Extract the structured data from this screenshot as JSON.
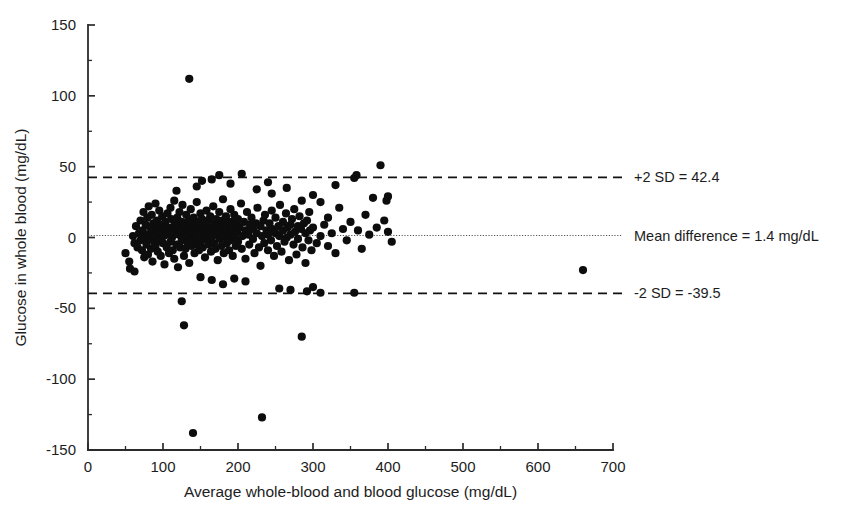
{
  "chart_data": {
    "type": "scatter",
    "title": "",
    "xlabel": "Average whole-blood and blood glucose (mg/dL)",
    "ylabel": "Glucose in whole blood (mg/dL)",
    "xlim": [
      0,
      700
    ],
    "ylim": [
      -150,
      150
    ],
    "xticks": [
      0,
      100,
      200,
      300,
      400,
      500,
      600,
      700
    ],
    "xtick_labels": [
      "0",
      "100",
      "200",
      "300",
      "400",
      "500",
      "600",
      "700"
    ],
    "x_minor_step": 50,
    "yticks": [
      -150,
      -100,
      -50,
      0,
      50,
      100,
      150
    ],
    "ytick_labels": [
      "-150",
      "-100",
      "-50",
      "0",
      "50",
      "100",
      "150"
    ],
    "y_minor_step": 25,
    "grid": false,
    "legend_position": "right-inline",
    "reference_lines": [
      {
        "name": "upper-limit-of-agreement",
        "label": "+2 SD = 42.4",
        "value": 42.4,
        "style": "dashed",
        "color": "#111111"
      },
      {
        "name": "mean-difference",
        "label": "Mean difference = 1.4 mg/dL",
        "value": 1.4,
        "style": "dotted",
        "color": "#555555"
      },
      {
        "name": "lower-limit-of-agreement",
        "label": "-2 SD = -39.5",
        "value": -39.5,
        "style": "dashed",
        "color": "#111111"
      }
    ],
    "marker": {
      "shape": "circle",
      "size": 4.1,
      "color": "#0d0d0d"
    },
    "points": [
      [
        50,
        -11
      ],
      [
        56,
        -22
      ],
      [
        60,
        1
      ],
      [
        62,
        -4
      ],
      [
        64,
        8
      ],
      [
        66,
        -7
      ],
      [
        68,
        3
      ],
      [
        70,
        12
      ],
      [
        70,
        -2
      ],
      [
        72,
        -9
      ],
      [
        73,
        5
      ],
      [
        74,
        18
      ],
      [
        75,
        -14
      ],
      [
        76,
        0
      ],
      [
        77,
        9
      ],
      [
        78,
        -5
      ],
      [
        79,
        14
      ],
      [
        80,
        2
      ],
      [
        80,
        -12
      ],
      [
        81,
        22
      ],
      [
        82,
        -1
      ],
      [
        83,
        7
      ],
      [
        84,
        -8
      ],
      [
        85,
        16
      ],
      [
        86,
        3
      ],
      [
        86,
        -17
      ],
      [
        87,
        10
      ],
      [
        88,
        -3
      ],
      [
        89,
        5
      ],
      [
        90,
        24
      ],
      [
        90,
        -6
      ],
      [
        91,
        1
      ],
      [
        92,
        12
      ],
      [
        93,
        -10
      ],
      [
        94,
        6
      ],
      [
        95,
        19
      ],
      [
        95,
        -2
      ],
      [
        96,
        8
      ],
      [
        97,
        -13
      ],
      [
        98,
        3
      ],
      [
        99,
        15
      ],
      [
        100,
        -4
      ],
      [
        100,
        9
      ],
      [
        101,
        1
      ],
      [
        102,
        -19
      ],
      [
        103,
        11
      ],
      [
        104,
        5
      ],
      [
        105,
        -7
      ],
      [
        106,
        17
      ],
      [
        107,
        2
      ],
      [
        108,
        -11
      ],
      [
        109,
        7
      ],
      [
        110,
        21
      ],
      [
        110,
        -3
      ],
      [
        111,
        13
      ],
      [
        112,
        0
      ],
      [
        113,
        -9
      ],
      [
        114,
        6
      ],
      [
        115,
        26
      ],
      [
        115,
        -15
      ],
      [
        116,
        10
      ],
      [
        117,
        3
      ],
      [
        118,
        -5
      ],
      [
        119,
        14
      ],
      [
        120,
        8
      ],
      [
        120,
        -21
      ],
      [
        121,
        2
      ],
      [
        122,
        18
      ],
      [
        123,
        -7
      ],
      [
        124,
        5
      ],
      [
        125,
        11
      ],
      [
        125,
        -2
      ],
      [
        126,
        23
      ],
      [
        127,
        0
      ],
      [
        128,
        -13
      ],
      [
        129,
        9
      ],
      [
        130,
        4
      ],
      [
        130,
        -8
      ],
      [
        131,
        16
      ],
      [
        132,
        1
      ],
      [
        133,
        -4
      ],
      [
        134,
        12
      ],
      [
        135,
        7
      ],
      [
        135,
        -18
      ],
      [
        136,
        3
      ],
      [
        137,
        20
      ],
      [
        138,
        -6
      ],
      [
        139,
        10
      ],
      [
        140,
        5
      ],
      [
        140,
        -1
      ],
      [
        141,
        14
      ],
      [
        142,
        -11
      ],
      [
        143,
        8
      ],
      [
        144,
        2
      ],
      [
        145,
        25
      ],
      [
        145,
        -5
      ],
      [
        146,
        11
      ],
      [
        147,
        0
      ],
      [
        148,
        -9
      ],
      [
        149,
        6
      ],
      [
        150,
        17
      ],
      [
        150,
        -3
      ],
      [
        151,
        9
      ],
      [
        152,
        13
      ],
      [
        153,
        -7
      ],
      [
        154,
        4
      ],
      [
        155,
        1
      ],
      [
        156,
        -14
      ],
      [
        157,
        8
      ],
      [
        158,
        19
      ],
      [
        159,
        -2
      ],
      [
        160,
        6
      ],
      [
        160,
        12
      ],
      [
        161,
        -5
      ],
      [
        162,
        3
      ],
      [
        163,
        15
      ],
      [
        164,
        -10
      ],
      [
        165,
        7
      ],
      [
        166,
        1
      ],
      [
        167,
        22
      ],
      [
        168,
        -4
      ],
      [
        169,
        10
      ],
      [
        170,
        5
      ],
      [
        170,
        -8
      ],
      [
        171,
        13
      ],
      [
        172,
        2
      ],
      [
        173,
        -16
      ],
      [
        174,
        9
      ],
      [
        175,
        4
      ],
      [
        175,
        18
      ],
      [
        176,
        -1
      ],
      [
        177,
        7
      ],
      [
        178,
        -6
      ],
      [
        179,
        12
      ],
      [
        180,
        3
      ],
      [
        180,
        27
      ],
      [
        181,
        -11
      ],
      [
        182,
        8
      ],
      [
        183,
        1
      ],
      [
        184,
        15
      ],
      [
        185,
        -4
      ],
      [
        186,
        6
      ],
      [
        187,
        10
      ],
      [
        188,
        -9
      ],
      [
        189,
        2
      ],
      [
        190,
        20
      ],
      [
        190,
        -2
      ],
      [
        191,
        11
      ],
      [
        192,
        5
      ],
      [
        193,
        -13
      ],
      [
        194,
        8
      ],
      [
        195,
        16
      ],
      [
        196,
        0
      ],
      [
        197,
        -6
      ],
      [
        198,
        9
      ],
      [
        199,
        4
      ],
      [
        200,
        13
      ],
      [
        200,
        -3
      ],
      [
        202,
        7
      ],
      [
        204,
        24
      ],
      [
        205,
        -8
      ],
      [
        206,
        1
      ],
      [
        208,
        11
      ],
      [
        210,
        5
      ],
      [
        210,
        -15
      ],
      [
        212,
        18
      ],
      [
        214,
        2
      ],
      [
        215,
        -5
      ],
      [
        216,
        9
      ],
      [
        218,
        14
      ],
      [
        220,
        -1
      ],
      [
        220,
        6
      ],
      [
        222,
        -11
      ],
      [
        224,
        10
      ],
      [
        225,
        3
      ],
      [
        226,
        21
      ],
      [
        228,
        -7
      ],
      [
        230,
        8
      ],
      [
        230,
        -20
      ],
      [
        232,
        1
      ],
      [
        234,
        12
      ],
      [
        235,
        -4
      ],
      [
        236,
        16
      ],
      [
        238,
        5
      ],
      [
        240,
        -9
      ],
      [
        240,
        2
      ],
      [
        242,
        10
      ],
      [
        244,
        -2
      ],
      [
        245,
        19
      ],
      [
        246,
        6
      ],
      [
        248,
        -13
      ],
      [
        250,
        3
      ],
      [
        250,
        14
      ],
      [
        252,
        -6
      ],
      [
        254,
        8
      ],
      [
        255,
        1
      ],
      [
        256,
        23
      ],
      [
        258,
        -10
      ],
      [
        260,
        5
      ],
      [
        260,
        11
      ],
      [
        262,
        -3
      ],
      [
        264,
        17
      ],
      [
        265,
        0
      ],
      [
        266,
        7
      ],
      [
        268,
        -16
      ],
      [
        270,
        9
      ],
      [
        270,
        2
      ],
      [
        272,
        13
      ],
      [
        274,
        -5
      ],
      [
        275,
        20
      ],
      [
        276,
        4
      ],
      [
        278,
        -12
      ],
      [
        280,
        8
      ],
      [
        280,
        -1
      ],
      [
        282,
        15
      ],
      [
        284,
        6
      ],
      [
        285,
        26
      ],
      [
        286,
        -7
      ],
      [
        288,
        10
      ],
      [
        290,
        3
      ],
      [
        290,
        -18
      ],
      [
        292,
        12
      ],
      [
        294,
        -2
      ],
      [
        295,
        18
      ],
      [
        296,
        5
      ],
      [
        298,
        -9
      ],
      [
        300,
        7
      ],
      [
        300,
        30
      ],
      [
        305,
        -4
      ],
      [
        310,
        25
      ],
      [
        310,
        1
      ],
      [
        315,
        9
      ],
      [
        320,
        -6
      ],
      [
        320,
        14
      ],
      [
        325,
        3
      ],
      [
        330,
        -11
      ],
      [
        335,
        21
      ],
      [
        340,
        6
      ],
      [
        345,
        -2
      ],
      [
        350,
        11
      ],
      [
        355,
        42
      ],
      [
        355,
        -39
      ],
      [
        358,
        44
      ],
      [
        360,
        5
      ],
      [
        365,
        -8
      ],
      [
        370,
        16
      ],
      [
        375,
        2
      ],
      [
        380,
        28
      ],
      [
        385,
        7
      ],
      [
        390,
        51
      ],
      [
        395,
        12
      ],
      [
        398,
        26
      ],
      [
        400,
        29
      ],
      [
        400,
        4
      ],
      [
        405,
        -3
      ],
      [
        660,
        -23
      ],
      [
        135,
        112
      ],
      [
        125,
        -45
      ],
      [
        128,
        -62
      ],
      [
        140,
        -138
      ],
      [
        232,
        -127
      ],
      [
        285,
        -70
      ],
      [
        300,
        -35
      ],
      [
        270,
        -37
      ],
      [
        255,
        -36
      ],
      [
        180,
        -33
      ],
      [
        165,
        -30
      ],
      [
        150,
        -28
      ],
      [
        195,
        -29
      ],
      [
        210,
        -31
      ],
      [
        62,
        -24
      ],
      [
        55,
        -17
      ],
      [
        145,
        36
      ],
      [
        152,
        40
      ],
      [
        118,
        33
      ],
      [
        205,
        45
      ],
      [
        245,
        31
      ],
      [
        265,
        35
      ],
      [
        330,
        37
      ],
      [
        292,
        -38
      ],
      [
        310,
        -39
      ],
      [
        165,
        41
      ],
      [
        175,
        44
      ],
      [
        190,
        38
      ],
      [
        225,
        34
      ],
      [
        240,
        39
      ]
    ]
  },
  "axes": {
    "x_title": "Average whole-blood and blood glucose (mg/dL)",
    "y_title": "Glucose in whole blood (mg/dL)"
  }
}
